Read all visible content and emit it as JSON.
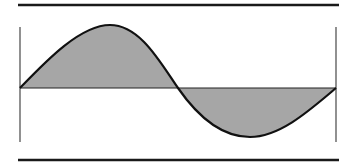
{
  "diagram": {
    "type": "sine-wave",
    "colors": {
      "background": "#ffffff",
      "stroke": "#111111",
      "fill": "#a6a6a6",
      "frame": "#555555"
    },
    "waveform": {
      "cycles": 1,
      "positive_half": "shaded above axis",
      "negative_half": "shaded below axis"
    }
  }
}
